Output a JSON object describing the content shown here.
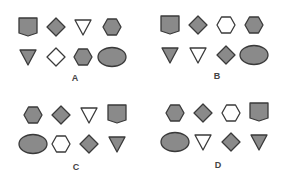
{
  "colors": {
    "filled": "#8a8a8a",
    "empty": "#ffffff",
    "stroke": "#3a3a3a"
  },
  "options": [
    {
      "label": "A",
      "x": 75,
      "y": 73,
      "shapes": [
        {
          "type": "pentagon",
          "fill": "filled",
          "x": 28,
          "y": 27
        },
        {
          "type": "diamond",
          "fill": "filled",
          "x": 56,
          "y": 27
        },
        {
          "type": "triangle-down",
          "fill": "empty",
          "x": 83,
          "y": 27
        },
        {
          "type": "hexagon",
          "fill": "filled",
          "x": 112,
          "y": 27
        },
        {
          "type": "triangle-down",
          "fill": "filled",
          "x": 28,
          "y": 57
        },
        {
          "type": "diamond",
          "fill": "empty",
          "x": 56,
          "y": 57
        },
        {
          "type": "hexagon",
          "fill": "filled",
          "x": 83,
          "y": 57
        },
        {
          "type": "ellipse",
          "fill": "filled",
          "x": 112,
          "y": 57
        }
      ]
    },
    {
      "label": "B",
      "x": 217,
      "y": 71,
      "shapes": [
        {
          "type": "pentagon",
          "fill": "filled",
          "x": 170,
          "y": 25
        },
        {
          "type": "diamond",
          "fill": "filled",
          "x": 198,
          "y": 25
        },
        {
          "type": "hexagon",
          "fill": "empty",
          "x": 226,
          "y": 25
        },
        {
          "type": "hexagon",
          "fill": "filled",
          "x": 254,
          "y": 25
        },
        {
          "type": "triangle-down",
          "fill": "filled",
          "x": 170,
          "y": 55
        },
        {
          "type": "triangle-down",
          "fill": "empty",
          "x": 198,
          "y": 55
        },
        {
          "type": "diamond",
          "fill": "filled",
          "x": 226,
          "y": 55
        },
        {
          "type": "ellipse",
          "fill": "filled",
          "x": 254,
          "y": 55
        }
      ]
    },
    {
      "label": "C",
      "x": 76,
      "y": 162,
      "shapes": [
        {
          "type": "hexagon",
          "fill": "filled",
          "x": 33,
          "y": 115
        },
        {
          "type": "diamond",
          "fill": "filled",
          "x": 61,
          "y": 115
        },
        {
          "type": "triangle-down",
          "fill": "empty",
          "x": 89,
          "y": 115
        },
        {
          "type": "pentagon",
          "fill": "filled",
          "x": 117,
          "y": 114
        },
        {
          "type": "ellipse",
          "fill": "filled",
          "x": 33,
          "y": 144
        },
        {
          "type": "hexagon",
          "fill": "empty",
          "x": 61,
          "y": 144
        },
        {
          "type": "diamond",
          "fill": "filled",
          "x": 89,
          "y": 144
        },
        {
          "type": "triangle-down",
          "fill": "filled",
          "x": 117,
          "y": 144
        }
      ]
    },
    {
      "label": "D",
      "x": 218,
      "y": 160,
      "shapes": [
        {
          "type": "hexagon",
          "fill": "filled",
          "x": 175,
          "y": 113
        },
        {
          "type": "diamond",
          "fill": "filled",
          "x": 203,
          "y": 113
        },
        {
          "type": "hexagon",
          "fill": "empty",
          "x": 231,
          "y": 113
        },
        {
          "type": "pentagon",
          "fill": "filled",
          "x": 259,
          "y": 112
        },
        {
          "type": "ellipse",
          "fill": "filled",
          "x": 175,
          "y": 142
        },
        {
          "type": "triangle-down",
          "fill": "empty",
          "x": 203,
          "y": 142
        },
        {
          "type": "diamond",
          "fill": "filled",
          "x": 231,
          "y": 142
        },
        {
          "type": "triangle-down",
          "fill": "filled",
          "x": 259,
          "y": 142
        }
      ]
    }
  ]
}
